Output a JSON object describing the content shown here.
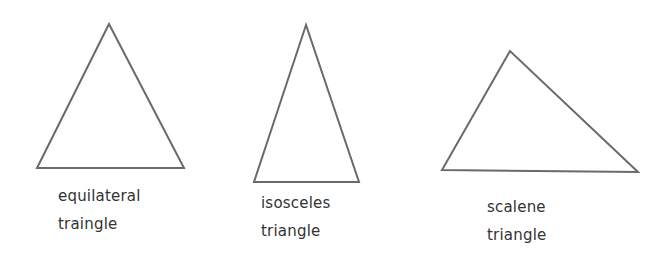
{
  "diagram": {
    "stroke_color": "#6a6a6a",
    "text_color": "#333333",
    "triangles": [
      {
        "type": "equilateral",
        "label_line1": "equilateral",
        "label_line2": "traingle",
        "points": "109,24 37,168 184,168"
      },
      {
        "type": "isosceles",
        "label_line1": "isosceles",
        "label_line2": "triangle",
        "points": "306,25 254,182 359,182"
      },
      {
        "type": "scalene",
        "label_line1": "scalene",
        "label_line2": "triangle",
        "points": "510,51 442,170 638,172"
      }
    ]
  }
}
